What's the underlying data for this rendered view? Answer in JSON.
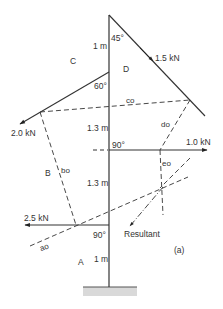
{
  "figure": {
    "caption": "(a)",
    "space_labels": {
      "A": "A",
      "B": "B",
      "C": "C",
      "D": "D"
    },
    "dimensions": {
      "top": "1 m",
      "upper_mid": "1.3 m",
      "lower_mid": "1.3 m",
      "bottom": "1 m"
    },
    "angles": {
      "top": "45°",
      "upper": "60°",
      "middle": "90°",
      "lower": "90°"
    },
    "forces": {
      "f1": {
        "label": "1.5 kN",
        "direction": "45° down-right"
      },
      "f2": {
        "label": "2.0 kN",
        "direction": "60° down-left"
      },
      "f3": {
        "label": "1.0 kN",
        "direction": "horizontal right"
      },
      "f4": {
        "label": "2.5 kN",
        "direction": "horizontal left"
      }
    },
    "funicular_rays": {
      "ao": "ao",
      "bo": "bo",
      "co": "co",
      "do": "do",
      "eo": "eo"
    },
    "resultant_label": "Resultant",
    "colors": {
      "line": "#333333",
      "ground": "#d9d9d9"
    }
  }
}
